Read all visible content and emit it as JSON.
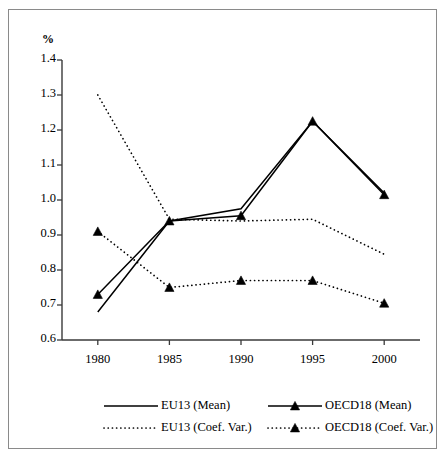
{
  "chart_data": {
    "type": "line",
    "title": "",
    "subtitle": "",
    "xlabel": "",
    "ylabel": "%",
    "unit_label": "%",
    "grid": false,
    "legend_position": "bottom",
    "categories": [
      "1980",
      "1985",
      "1990",
      "1995",
      "2000"
    ],
    "x": [
      1980,
      1985,
      1990,
      1995,
      2000
    ],
    "xlim": [
      1977.5,
      2002.5
    ],
    "ylim": [
      0.6,
      1.4
    ],
    "yticks": [
      "0.6",
      "0.7",
      "0.8",
      "0.9",
      "1.0",
      "1.1",
      "1.2",
      "1.3",
      "1.4"
    ],
    "ytick_values": [
      0.6,
      0.7,
      0.8,
      0.9,
      1.0,
      1.1,
      1.2,
      1.3,
      1.4
    ],
    "xticks": [
      "1980",
      "1985",
      "1990",
      "1995",
      "2000"
    ],
    "series": [
      {
        "name": "EU13 (Mean)",
        "style": "solid",
        "marker": "none",
        "color": "#000000",
        "values": [
          0.68,
          0.94,
          0.975,
          1.225,
          1.02
        ]
      },
      {
        "name": "OECD18 (Mean)",
        "style": "solid",
        "marker": "triangle",
        "color": "#000000",
        "values": [
          0.73,
          0.94,
          0.955,
          1.225,
          1.015
        ]
      },
      {
        "name": "EU13 (Coef. Var.)",
        "style": "dotted",
        "marker": "none",
        "color": "#000000",
        "values": [
          1.3,
          0.945,
          0.94,
          0.945,
          0.845
        ]
      },
      {
        "name": "OECD18 (Coef. Var.)",
        "style": "dotted",
        "marker": "triangle",
        "color": "#000000",
        "values": [
          0.91,
          0.75,
          0.77,
          0.77,
          0.705
        ]
      }
    ],
    "legend": [
      {
        "label": "EU13 (Mean)",
        "style": "solid",
        "marker": "none"
      },
      {
        "label": "OECD18 (Mean)",
        "style": "solid",
        "marker": "triangle"
      },
      {
        "label": "EU13 (Coef. Var.)",
        "style": "dotted",
        "marker": "none"
      },
      {
        "label": "OECD18 (Coef. Var.)",
        "style": "dotted",
        "marker": "triangle"
      }
    ]
  }
}
